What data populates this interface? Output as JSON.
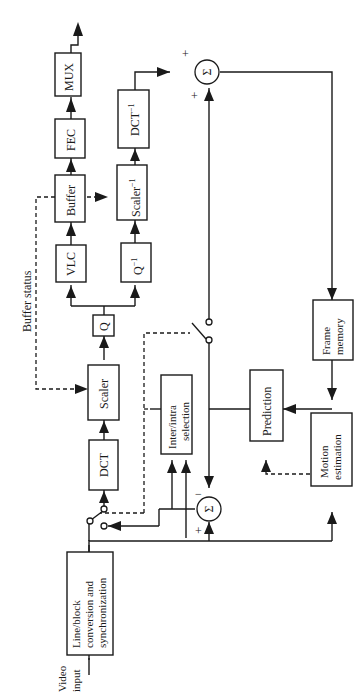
{
  "diagram": {
    "orientation": "rotated 90deg counter-clockwise (text reads bottom-to-top)",
    "colors": {
      "line": "#1a1a1a",
      "background": "#ffffff"
    },
    "blocks": {
      "line_block": {
        "line1": "Line/block",
        "line2": "conversion and",
        "line3": "synchronization"
      },
      "dct": {
        "label": "DCT"
      },
      "scaler": {
        "label": "Scaler"
      },
      "q": {
        "label": "Q"
      },
      "vlc": {
        "label": "VLC"
      },
      "q_inv": {
        "label": "Q",
        "sup": "−1"
      },
      "buffer": {
        "label": "Buffer"
      },
      "scaler_inv": {
        "label": "Scaler",
        "sup": "−1"
      },
      "fec": {
        "label": "FEC"
      },
      "dct_inv": {
        "label": "DCT",
        "sup": "−1"
      },
      "mux": {
        "label": "MUX"
      },
      "inter_intra": {
        "line1": "Inter/intra",
        "line2": "selection"
      },
      "prediction": {
        "label": "Prediction"
      },
      "frame_memory": {
        "line1": "Frame",
        "line2": "memory"
      },
      "motion_estimation": {
        "line1": "Motion",
        "line2": "estimation"
      }
    },
    "summers": {
      "top": {
        "symbol": "Σ",
        "sign_a": "+",
        "sign_b": "+"
      },
      "bottom": {
        "symbol": "Σ",
        "sign_a": "−",
        "sign_b": "+"
      }
    },
    "labels": {
      "video_input_1": "Video",
      "video_input_2": "input",
      "buffer_status": "Buffer status"
    }
  }
}
